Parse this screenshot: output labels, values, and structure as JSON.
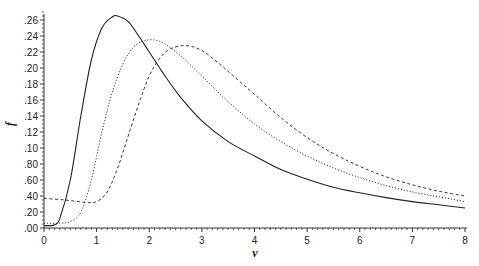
{
  "chart_data": {
    "type": "line",
    "title": "",
    "xlabel": "v",
    "ylabel": "f",
    "xlim": [
      0,
      8
    ],
    "ylim": [
      0,
      0.26
    ],
    "grid": false,
    "legend": null,
    "x_ticks": [
      "0",
      "1",
      "2",
      "3",
      "4",
      "5",
      "6",
      "7",
      "8"
    ],
    "y_ticks": [
      ".00",
      ".20",
      ".40",
      ".60",
      ".80",
      ".10",
      ".12",
      ".14",
      ".16",
      ".18",
      ".20",
      ".22",
      ".24",
      ".26"
    ],
    "series": [
      {
        "name": "solid",
        "style": "solid",
        "x": [
          0,
          0.1,
          0.2,
          0.3,
          0.5,
          0.7,
          0.9,
          1.1,
          1.3,
          1.4,
          1.6,
          1.8,
          2.0,
          2.3,
          2.6,
          3.0,
          3.5,
          4.0,
          4.5,
          5.0,
          5.5,
          6.0,
          6.5,
          7.0,
          7.5,
          8.0
        ],
        "y": [
          0.003,
          0.003,
          0.004,
          0.012,
          0.06,
          0.14,
          0.21,
          0.25,
          0.264,
          0.265,
          0.258,
          0.24,
          0.22,
          0.19,
          0.163,
          0.134,
          0.108,
          0.09,
          0.073,
          0.061,
          0.051,
          0.044,
          0.038,
          0.033,
          0.029,
          0.025
        ]
      },
      {
        "name": "dotted",
        "style": "dotted",
        "x": [
          0,
          0.3,
          0.5,
          0.7,
          0.9,
          1.1,
          1.3,
          1.5,
          1.7,
          1.9,
          2.1,
          2.3,
          2.6,
          3.0,
          3.5,
          4.0,
          4.5,
          5.0,
          5.5,
          6.0,
          6.5,
          7.0,
          7.5,
          8.0
        ],
        "y": [
          0.006,
          0.006,
          0.008,
          0.02,
          0.06,
          0.12,
          0.17,
          0.205,
          0.226,
          0.234,
          0.235,
          0.23,
          0.215,
          0.19,
          0.158,
          0.13,
          0.108,
          0.09,
          0.075,
          0.063,
          0.053,
          0.045,
          0.039,
          0.033
        ]
      },
      {
        "name": "dashed",
        "style": "dashed",
        "x": [
          0,
          0.4,
          0.8,
          1.0,
          1.2,
          1.4,
          1.6,
          1.8,
          2.0,
          2.2,
          2.4,
          2.7,
          3.0,
          3.3,
          3.6,
          4.0,
          4.5,
          5.0,
          5.5,
          6.0,
          6.5,
          7.0,
          7.5,
          8.0
        ],
        "y": [
          0.037,
          0.035,
          0.032,
          0.033,
          0.045,
          0.075,
          0.115,
          0.155,
          0.19,
          0.212,
          0.224,
          0.228,
          0.222,
          0.207,
          0.19,
          0.167,
          0.138,
          0.113,
          0.093,
          0.077,
          0.064,
          0.054,
          0.046,
          0.04
        ]
      }
    ]
  }
}
